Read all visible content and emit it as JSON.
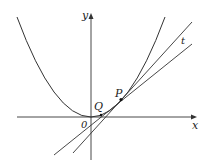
{
  "diagram": {
    "type": "function-graph",
    "labels": {
      "y_axis": "y",
      "x_axis": "x",
      "origin": "0",
      "point_p": "P",
      "point_q": "Q",
      "tangent": "t"
    },
    "colors": {
      "stroke": "#333333",
      "background": "#ffffff"
    }
  }
}
